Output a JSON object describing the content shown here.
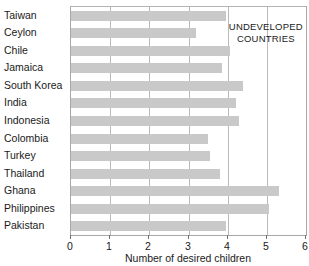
{
  "chart_data": {
    "type": "bar",
    "orientation": "horizontal",
    "title": "",
    "xlabel": "Number of desired children",
    "ylabel": "",
    "xlim": [
      0,
      6
    ],
    "xticks": [
      0,
      1,
      2,
      3,
      4,
      5,
      6
    ],
    "xtick_labels": [
      "0",
      "1",
      "2",
      "3",
      "4",
      "5",
      "6"
    ],
    "grid": true,
    "grid_axis": "x",
    "legend": false,
    "categories": [
      "Taiwan",
      "Ceylon",
      "Chile",
      "Jamaica",
      "South Korea",
      "India",
      "Indonesia",
      "Colombia",
      "Turkey",
      "Thailand",
      "Ghana",
      "Philippines",
      "Pakistan"
    ],
    "values": [
      3.95,
      3.2,
      4.05,
      3.85,
      4.4,
      4.2,
      4.3,
      3.5,
      3.55,
      3.8,
      5.3,
      5.05,
      3.95
    ],
    "bar_color": "#c9c9c9",
    "annotations": [
      {
        "name": "undeveloped-countries-annotation",
        "line1": "UNDEVELOPED",
        "line2": "COUNTRIES",
        "x": 5.0,
        "y_category": "Ceylon"
      }
    ]
  }
}
